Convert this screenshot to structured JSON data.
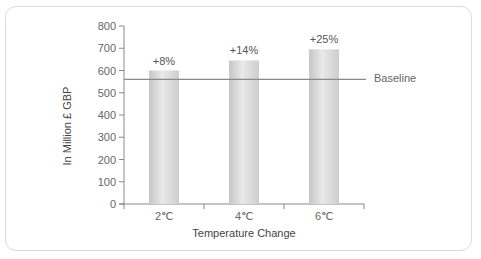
{
  "chart_data": {
    "type": "bar",
    "title": "",
    "xlabel": "Temperature Change",
    "ylabel": "In Million £ GBP",
    "categories": [
      "2℃",
      "4℃",
      "6℃"
    ],
    "values": [
      600,
      645,
      695
    ],
    "bar_labels": [
      "+8%",
      "+14%",
      "+25%"
    ],
    "ylim": [
      0,
      800
    ],
    "yticks": [
      0,
      100,
      200,
      300,
      400,
      500,
      600,
      700,
      800
    ],
    "grid": false,
    "legend": null,
    "reference_line": {
      "label": "Baseline",
      "value": 560
    },
    "colors": {
      "bar_edge": "#c8c8c8",
      "bar_center": "#e8e8e8",
      "axis": "#888888",
      "baseline": "#8a8a8a",
      "frame": "#dcdcdc"
    }
  }
}
